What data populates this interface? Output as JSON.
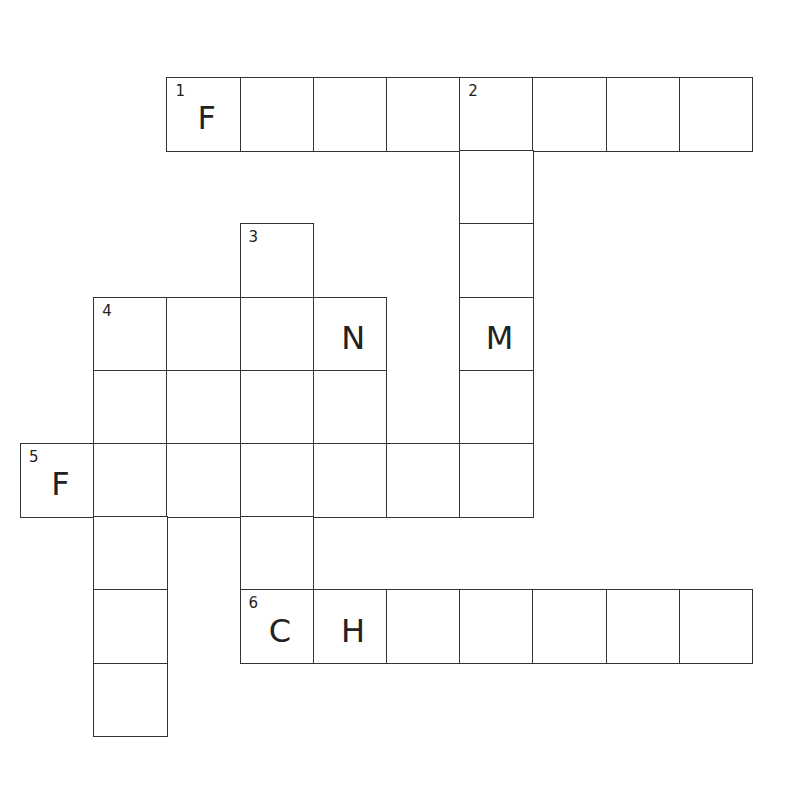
{
  "puzzle": {
    "type": "crossword",
    "colors": {
      "line": "#333333",
      "cell_bg": "#ffffff",
      "text": "#222222"
    },
    "grid_origin": {
      "x": 20,
      "y": 77
    },
    "cell_size": 73.2,
    "cells": [
      {
        "r": 0,
        "c": 2,
        "num": "1",
        "letter": "F"
      },
      {
        "r": 0,
        "c": 3,
        "num": "",
        "letter": ""
      },
      {
        "r": 0,
        "c": 4,
        "num": "",
        "letter": ""
      },
      {
        "r": 0,
        "c": 5,
        "num": "",
        "letter": ""
      },
      {
        "r": 0,
        "c": 6,
        "num": "2",
        "letter": ""
      },
      {
        "r": 0,
        "c": 7,
        "num": "",
        "letter": ""
      },
      {
        "r": 0,
        "c": 8,
        "num": "",
        "letter": ""
      },
      {
        "r": 0,
        "c": 9,
        "num": "",
        "letter": ""
      },
      {
        "r": 1,
        "c": 6,
        "num": "",
        "letter": ""
      },
      {
        "r": 2,
        "c": 3,
        "num": "3",
        "letter": ""
      },
      {
        "r": 2,
        "c": 6,
        "num": "",
        "letter": ""
      },
      {
        "r": 3,
        "c": 1,
        "num": "4",
        "letter": ""
      },
      {
        "r": 3,
        "c": 2,
        "num": "",
        "letter": ""
      },
      {
        "r": 3,
        "c": 3,
        "num": "",
        "letter": ""
      },
      {
        "r": 3,
        "c": 4,
        "num": "",
        "letter": "N"
      },
      {
        "r": 3,
        "c": 6,
        "num": "",
        "letter": "M"
      },
      {
        "r": 4,
        "c": 1,
        "num": "",
        "letter": ""
      },
      {
        "r": 4,
        "c": 2,
        "num": "",
        "letter": ""
      },
      {
        "r": 4,
        "c": 3,
        "num": "",
        "letter": ""
      },
      {
        "r": 4,
        "c": 4,
        "num": "",
        "letter": ""
      },
      {
        "r": 4,
        "c": 6,
        "num": "",
        "letter": ""
      },
      {
        "r": 5,
        "c": 0,
        "num": "5",
        "letter": "F"
      },
      {
        "r": 5,
        "c": 1,
        "num": "",
        "letter": ""
      },
      {
        "r": 5,
        "c": 2,
        "num": "",
        "letter": ""
      },
      {
        "r": 5,
        "c": 3,
        "num": "",
        "letter": ""
      },
      {
        "r": 5,
        "c": 4,
        "num": "",
        "letter": ""
      },
      {
        "r": 5,
        "c": 5,
        "num": "",
        "letter": ""
      },
      {
        "r": 5,
        "c": 6,
        "num": "",
        "letter": ""
      },
      {
        "r": 6,
        "c": 1,
        "num": "",
        "letter": ""
      },
      {
        "r": 6,
        "c": 3,
        "num": "",
        "letter": ""
      },
      {
        "r": 7,
        "c": 1,
        "num": "",
        "letter": ""
      },
      {
        "r": 7,
        "c": 3,
        "num": "6",
        "letter": "C"
      },
      {
        "r": 7,
        "c": 4,
        "num": "",
        "letter": "H"
      },
      {
        "r": 7,
        "c": 5,
        "num": "",
        "letter": ""
      },
      {
        "r": 7,
        "c": 6,
        "num": "",
        "letter": ""
      },
      {
        "r": 7,
        "c": 7,
        "num": "",
        "letter": ""
      },
      {
        "r": 7,
        "c": 8,
        "num": "",
        "letter": ""
      },
      {
        "r": 7,
        "c": 9,
        "num": "",
        "letter": ""
      },
      {
        "r": 8,
        "c": 1,
        "num": "",
        "letter": ""
      }
    ],
    "words": [
      {
        "number": "1",
        "direction": "across",
        "length": 8,
        "given": "F"
      },
      {
        "number": "2",
        "direction": "down",
        "length": 6,
        "given": "M (4th)"
      },
      {
        "number": "3",
        "direction": "down",
        "length": 6
      },
      {
        "number": "4",
        "direction": "across",
        "length": 4,
        "given": "N (4th)"
      },
      {
        "number": "4",
        "direction": "down",
        "length": 6
      },
      {
        "number": "5",
        "direction": "across",
        "length": 7,
        "given": "F"
      },
      {
        "number": "6",
        "direction": "across",
        "length": 7,
        "given": "CH"
      }
    ]
  }
}
